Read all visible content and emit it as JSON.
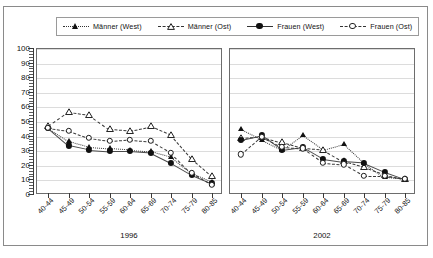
{
  "legend": {
    "items": [
      {
        "label": "Männer (West)",
        "marker": "triangle-filled",
        "line": "dotted",
        "color": "#111111"
      },
      {
        "label": "Männer (Ost)",
        "marker": "triangle-open",
        "line": "dashed",
        "color": "#111111"
      },
      {
        "label": "Frauen (West)",
        "marker": "circle-filled",
        "line": "solid",
        "color": "#111111"
      },
      {
        "label": "Frauen (Ost)",
        "marker": "circle-open",
        "line": "dashed",
        "color": "#111111"
      }
    ]
  },
  "axis": {
    "y_ticks": [
      "100",
      "90",
      "80",
      "70",
      "60",
      "50",
      "40",
      "30",
      "20",
      "10",
      "0"
    ],
    "y_min": 0,
    "y_max": 100,
    "y_step": 10
  },
  "panels": [
    {
      "caption": "1996"
    },
    {
      "caption": "2002"
    }
  ],
  "chart_data": {
    "type": "line",
    "title": "",
    "xlabel": "",
    "ylabel": "",
    "ylim": [
      0,
      100
    ],
    "grid": true,
    "legend_position": "top",
    "panels": [
      {
        "caption": "1996",
        "categories": [
          "40-44",
          "45-49",
          "50-54",
          "55-59",
          "60-64",
          "65-69",
          "70-74",
          "75-79",
          "80-85"
        ],
        "series": [
          {
            "name": "Männer (West)",
            "marker": "triangle-filled",
            "line": "dotted",
            "values": [
              46,
              37,
              33,
              32,
              31,
              30,
              26,
              15,
              9
            ]
          },
          {
            "name": "Männer (Ost)",
            "marker": "triangle-open",
            "line": "dashed",
            "values": [
              47,
              57,
              55,
              45,
              44,
              47,
              41,
              25,
              13
            ]
          },
          {
            "name": "Frauen (West)",
            "marker": "circle-filled",
            "line": "solid",
            "values": [
              46,
              34,
              31,
              30,
              30,
              29,
              22,
              14,
              8
            ]
          },
          {
            "name": "Frauen (Ost)",
            "marker": "circle-open",
            "line": "dashed",
            "values": [
              46,
              44,
              39,
              37,
              38,
              37,
              29,
              15,
              7
            ]
          }
        ]
      },
      {
        "caption": "2002",
        "categories": [
          "40-44",
          "45-49",
          "50-54",
          "55-59",
          "60-64",
          "65-69",
          "70-74",
          "75-79",
          "80-85"
        ],
        "series": [
          {
            "name": "Männer (West)",
            "marker": "triangle-filled",
            "line": "dotted",
            "values": [
              45,
              38,
              31,
              41,
              31,
              35,
              22,
              12,
              11
            ]
          },
          {
            "name": "Männer (Ost)",
            "marker": "triangle-open",
            "line": "dashed",
            "values": [
              39,
              40,
              36,
              32,
              31,
              23,
              19,
              14,
              11
            ]
          },
          {
            "name": "Frauen (West)",
            "marker": "circle-filled",
            "line": "solid",
            "values": [
              38,
              41,
              31,
              33,
              25,
              23,
              22,
              16,
              11
            ]
          },
          {
            "name": "Frauen (Ost)",
            "marker": "circle-open",
            "line": "dashed",
            "values": [
              28,
              40,
              33,
              32,
              22,
              21,
              13,
              13,
              11
            ]
          }
        ]
      }
    ]
  }
}
